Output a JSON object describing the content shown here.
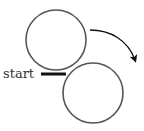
{
  "diagram": {
    "label_start": "start",
    "circles": [
      {
        "name": "upper-circle",
        "cx": 56,
        "cy": 40,
        "r": 30
      },
      {
        "name": "lower-circle",
        "cx": 93,
        "cy": 93,
        "r": 30
      }
    ],
    "start_marker": {
      "x1": 41,
      "y1": 74,
      "x2": 66,
      "y2": 74
    },
    "arrow": {
      "direction": "clockwise",
      "from": [
        90,
        30
      ],
      "to": [
        136,
        62
      ]
    },
    "colors": {
      "stroke": "#555555",
      "bar": "#111111",
      "arrow": "#111111"
    }
  }
}
